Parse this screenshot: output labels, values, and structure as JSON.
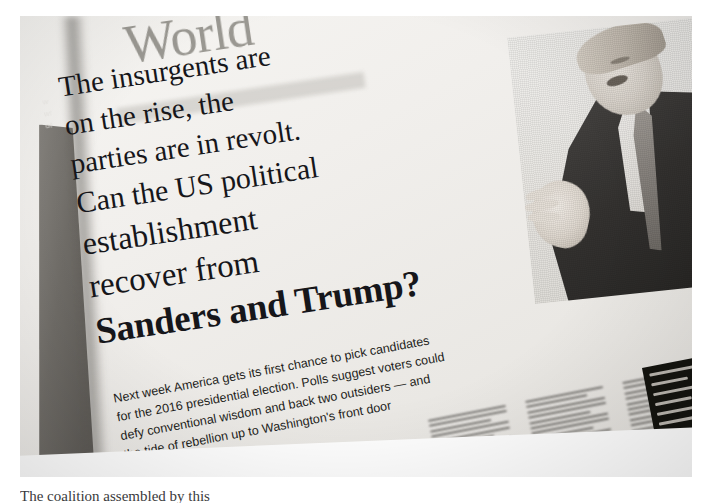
{
  "photograph": {
    "subject": "newspaper-page",
    "section_masthead": "World",
    "headline_lines": [
      "The insurgents are",
      "on the rise, the",
      "parties are in revolt.",
      "Can the US political",
      "establishment",
      "recover from",
      "Sanders and Trump?"
    ],
    "standfirst_lines": [
      "Next week America gets its first chance to pick candidates",
      "for the 2016 presidential election. Polls suggest voters could",
      "defy conventional wisdom and back two outsiders — and",
      "the tide of rebellion up to Washington's front door"
    ],
    "photo_caption_alt": "Donald Trump gesturing while speaking",
    "under_sheet_fragments": [
      "w",
      "wi",
      "of"
    ],
    "cut_off_caption": "The coalition assembled by this",
    "colors": {
      "paper": "#f1efec",
      "ink": "#16161a",
      "masthead": "#9a9892",
      "shadow": "#56534f",
      "promo_block": "#14140f",
      "page_white": "#ffffff"
    }
  }
}
